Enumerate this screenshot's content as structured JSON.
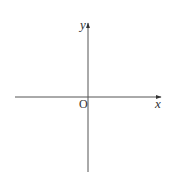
{
  "diagram": {
    "type": "cartesian-axes",
    "axes": {
      "x_label": "x",
      "y_label": "y",
      "origin_label": "O"
    },
    "colors": {
      "axis": "#555555",
      "text": "#333333",
      "background": "#ffffff"
    }
  }
}
